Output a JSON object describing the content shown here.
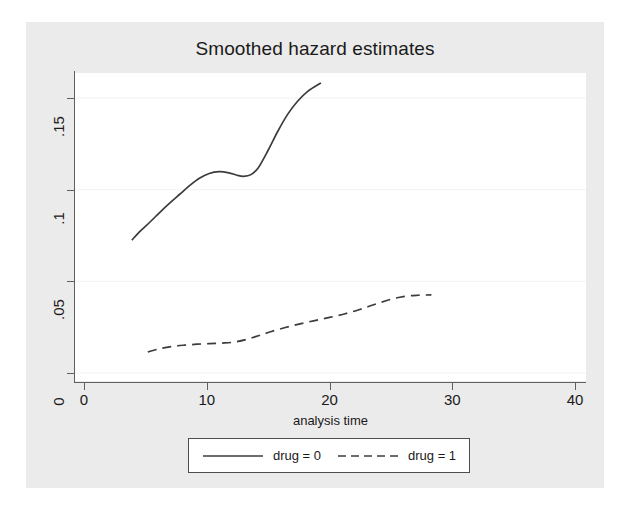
{
  "chart_data": {
    "type": "line",
    "title": "Smoothed hazard estimates",
    "xlabel": "analysis time",
    "ylabel": "",
    "xlim": [
      0,
      40
    ],
    "ylim": [
      0,
      0.165
    ],
    "xticks": [
      "0",
      "10",
      "20",
      "30",
      "40"
    ],
    "xtick_values": [
      0,
      10,
      20,
      30,
      40
    ],
    "yticks": [
      "0",
      ".05",
      ".1",
      ".15"
    ],
    "ytick_values": [
      0,
      0.05,
      0.1,
      0.15
    ],
    "grid": "horizontal",
    "legend_position": "bottom",
    "series": [
      {
        "name": "drug = 0",
        "style": "solid",
        "color": "#3c3c3c",
        "x": [
          3.9,
          4.6,
          5.4,
          6.2,
          7.0,
          7.8,
          8.6,
          9.4,
          10.2,
          11.0,
          11.8,
          12.4,
          13.0,
          13.6,
          14.2,
          15.0,
          15.8,
          16.6,
          17.4,
          18.2,
          19.3
        ],
        "y": [
          0.0725,
          0.0775,
          0.0825,
          0.0878,
          0.0928,
          0.0975,
          0.1022,
          0.1062,
          0.1088,
          0.1098,
          0.1092,
          0.108,
          0.1073,
          0.1082,
          0.112,
          0.1215,
          0.132,
          0.1412,
          0.1482,
          0.1535,
          0.1582
        ]
      },
      {
        "name": "drug = 1",
        "style": "dashed",
        "color": "#3c3c3c",
        "x": [
          5.2,
          6.2,
          7.2,
          8.2,
          9.2,
          10.2,
          11.2,
          12.2,
          13.2,
          14.2,
          15.2,
          16.4,
          17.6,
          18.8,
          20.0,
          21.2,
          22.4,
          23.6,
          24.8,
          26.0,
          27.2,
          28.3
        ],
        "y": [
          0.0115,
          0.0133,
          0.0145,
          0.0152,
          0.0157,
          0.016,
          0.0163,
          0.0168,
          0.0182,
          0.0203,
          0.0225,
          0.0248,
          0.0268,
          0.0286,
          0.0303,
          0.0322,
          0.0345,
          0.0372,
          0.0398,
          0.0417,
          0.0424,
          0.0426
        ]
      }
    ]
  },
  "legend": {
    "entries": [
      {
        "label": "drug = 0",
        "style": "solid"
      },
      {
        "label": "drug = 1",
        "style": "dashed"
      }
    ]
  },
  "colors": {
    "page_background": "#ffffff",
    "graph_background": "#ebebeb",
    "plot_background": "#ffffff",
    "axis": "#5f5f5f",
    "gridline": "#f2f2f2",
    "line": "#3c3c3c",
    "text": "#1a1a1a"
  }
}
